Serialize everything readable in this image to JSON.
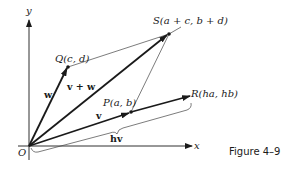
{
  "figure": {
    "caption": "Figure 4–9",
    "axes": {
      "x_label": "x",
      "y_label": "y",
      "origin_label": "O"
    },
    "points": {
      "Q": "Q(c, d)",
      "S": "S(a + c, b + d)",
      "P": "P(a, b)",
      "R": "R(ha, hb)"
    },
    "vectors": {
      "v": "v",
      "w": "w",
      "sum": "v + w",
      "scaled": "hv"
    },
    "colors": {
      "ink": "#1a1a1a",
      "background": "#ffffff"
    }
  }
}
